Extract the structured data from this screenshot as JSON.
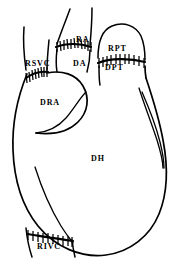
{
  "figure": {
    "background_color": "#ffffff",
    "line_color": "#000000",
    "width": 188,
    "height": 268
  },
  "labels": {
    "rsvc": "RSVC",
    "ra": "RA",
    "da": "DA",
    "rpt": "RPT",
    "dpt": "DPT",
    "dra": "DRA",
    "dh": "DH",
    "rivc": "RIVC"
  },
  "structures": [
    {
      "abbr": "RSVC",
      "position": "upper-left",
      "type": "recipient-vessel"
    },
    {
      "abbr": "RA",
      "position": "top-center",
      "type": "recipient-vessel"
    },
    {
      "abbr": "DA",
      "position": "upper-center",
      "type": "donor-vessel"
    },
    {
      "abbr": "RPT",
      "position": "upper-right",
      "type": "recipient-vessel"
    },
    {
      "abbr": "DPT",
      "position": "upper-right",
      "type": "donor-vessel"
    },
    {
      "abbr": "DRA",
      "position": "left-middle",
      "type": "donor-chamber"
    },
    {
      "abbr": "DH",
      "position": "center",
      "type": "donor-organ"
    },
    {
      "abbr": "RIVC",
      "position": "bottom-left",
      "type": "recipient-vessel"
    }
  ],
  "anastomoses": [
    {
      "name": "aortic-suture-line",
      "between": [
        "RA",
        "DA"
      ],
      "stitch_count": 11
    },
    {
      "name": "pulmonary-trunk-suture-line",
      "between": [
        "RPT",
        "DPT"
      ],
      "stitch_count": 11
    },
    {
      "name": "superior-caval-suture-line",
      "between": [
        "RSVC",
        "DRA"
      ],
      "stitch_count": 11
    },
    {
      "name": "inferior-caval-suture-line",
      "between": [
        "RIVC",
        "DRA"
      ],
      "stitch_count": 10
    }
  ]
}
